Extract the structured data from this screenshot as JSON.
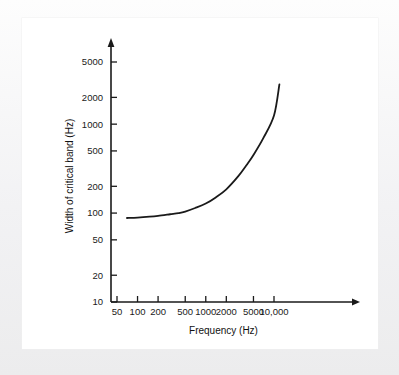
{
  "figure": {
    "background_color": "#ffffff",
    "page_border_color": "#ececed",
    "ink_color": "#1a1a1a"
  },
  "chart_data": {
    "type": "line",
    "title": "",
    "subtitle": "",
    "xlabel": "Frequency (Hz)",
    "ylabel": "Width of critical band (Hz)",
    "xscale": "log",
    "yscale": "log",
    "xlim": [
      40,
      16000
    ],
    "ylim": [
      10,
      8000
    ],
    "grid": false,
    "legend": null,
    "xticks": [
      50,
      100,
      200,
      500,
      1000,
      2000,
      5000,
      10000
    ],
    "xticklabels": [
      "50",
      "100",
      "200",
      "500",
      "1000",
      "2000",
      "5000",
      "10,000"
    ],
    "yticks": [
      10,
      20,
      50,
      100,
      200,
      500,
      1000,
      2000,
      5000
    ],
    "yticklabels": [
      "10",
      "20",
      "50",
      "100",
      "200",
      "500",
      "1000",
      "2000",
      "5000"
    ],
    "axis_arrows": [
      "x-right",
      "y-up"
    ],
    "series": [
      {
        "name": "Width of critical band",
        "color": "#1a1a1a",
        "linewidth": 1.8,
        "x": [
          70,
          100,
          150,
          200,
          300,
          400,
          500,
          700,
          1000,
          1400,
          2000,
          3000,
          4000,
          5000,
          7000,
          10000,
          12000
        ],
        "y": [
          88,
          89,
          91,
          93,
          97,
          100,
          104,
          114,
          128,
          150,
          185,
          260,
          350,
          450,
          700,
          1250,
          2800
        ]
      }
    ],
    "annotations": []
  },
  "axis_labels": {
    "x_title": "Frequency (Hz)",
    "y_title": "Width of critical band (Hz)"
  }
}
